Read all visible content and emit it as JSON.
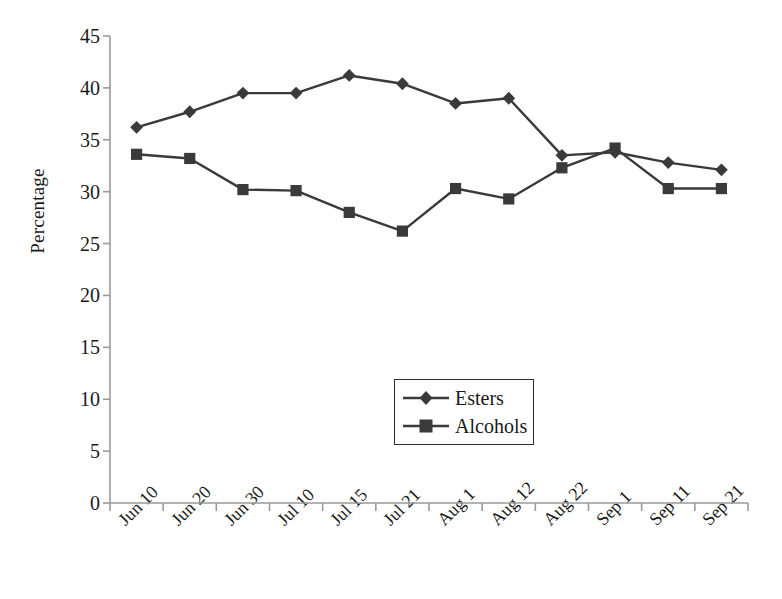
{
  "chart_data": {
    "type": "line",
    "title": "",
    "xlabel": "",
    "ylabel": "Percentage",
    "ylim": [
      0,
      45
    ],
    "ytick_step": 5,
    "yticks": [
      "45",
      "40",
      "35",
      "30",
      "25",
      "20",
      "15",
      "10",
      "5",
      "0"
    ],
    "grid": false,
    "legend_position": "center-bottom-inside",
    "categories": [
      "Jun 10",
      "Jun 20",
      "Jun 30",
      "Jul 10",
      "Jul 15",
      "Jul 21",
      "Aug 1",
      "Aug 12",
      "Aug 22",
      "Sep 1",
      "Sep 11",
      "Sep 21"
    ],
    "series": [
      {
        "name": "Esters",
        "marker": "diamond",
        "color": "#3a3a3a",
        "values": [
          36.2,
          37.7,
          39.5,
          39.5,
          41.2,
          40.4,
          38.5,
          39.0,
          33.5,
          33.8,
          32.8,
          32.1
        ]
      },
      {
        "name": "Alcohols",
        "marker": "square",
        "color": "#3a3a3a",
        "values": [
          33.6,
          33.2,
          30.2,
          30.1,
          28.0,
          26.2,
          30.3,
          29.3,
          32.3,
          34.2,
          30.3,
          30.3
        ]
      }
    ]
  },
  "axes": {
    "y_axis_title": "Percentage"
  },
  "legend": {
    "entries": [
      {
        "label": "Esters"
      },
      {
        "label": "Alcohols"
      }
    ]
  },
  "colors": {
    "line": "#3a3a3a",
    "axis": "#9a9a9a",
    "text": "#1a1a1a"
  }
}
